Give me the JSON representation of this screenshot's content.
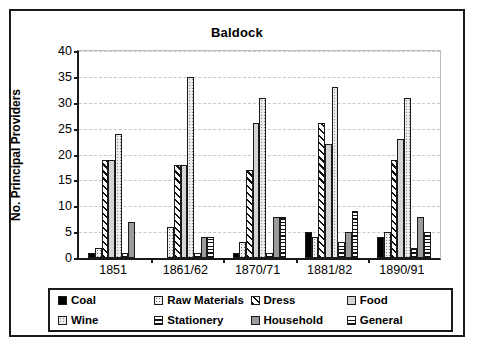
{
  "chart_data": {
    "type": "bar",
    "title": "Baldock",
    "xlabel": "",
    "ylabel": "No. Principal Providers",
    "categories": [
      "1851",
      "1861/62",
      "1870/71",
      "1881/82",
      "1890/91"
    ],
    "ylim": [
      0,
      40
    ],
    "yticks": [
      0,
      5,
      10,
      15,
      20,
      25,
      30,
      35,
      40
    ],
    "grid": true,
    "legend_position": "bottom",
    "series": [
      {
        "name": "Coal",
        "pattern": "solid-black",
        "values": [
          1,
          0,
          1,
          5,
          4
        ]
      },
      {
        "name": "Raw Materials",
        "pattern": "light-dotted",
        "values": [
          2,
          6,
          3,
          4,
          5
        ]
      },
      {
        "name": "Dress",
        "pattern": "diagonal-hatch",
        "values": [
          19,
          18,
          17,
          26,
          19
        ]
      },
      {
        "name": "Food",
        "pattern": "solid-light-gray",
        "values": [
          19,
          18,
          26,
          22,
          23
        ]
      },
      {
        "name": "Wine",
        "pattern": "gray-dotted",
        "values": [
          24,
          35,
          31,
          33,
          31
        ]
      },
      {
        "name": "Stationery",
        "pattern": "horizontal-lines",
        "values": [
          1,
          1,
          1,
          3,
          2
        ]
      },
      {
        "name": "Household",
        "pattern": "solid-mid-gray",
        "values": [
          7,
          4,
          8,
          5,
          8
        ]
      },
      {
        "name": "General",
        "pattern": "crosshatch-grid",
        "values": [
          0,
          4,
          8,
          9,
          5
        ]
      }
    ]
  },
  "colors": {
    "axis": "#1a1a1a",
    "gridline": "#c8c8c8",
    "plot_background": "#ffffff",
    "frame_border": "#1a1a1a",
    "coal": "#000000",
    "food": "#d4d4d4",
    "household": "#9b9b9b"
  }
}
